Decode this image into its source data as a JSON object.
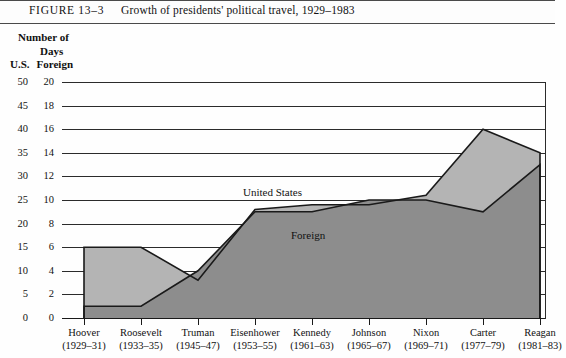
{
  "figure": {
    "number": "FIGURE 13–3",
    "title": "Growth of presidents' political travel, 1929–1983"
  },
  "axis_titles": {
    "line1": "Number of",
    "line2": "Days",
    "us": "U.S.",
    "foreign": "Foreign"
  },
  "colors": {
    "us_fill": "#b4b4b4",
    "foreign_fill": "#8d8d8d",
    "line": "#1a1a1a",
    "grid": "#2b2b2b",
    "background": "#fefefe"
  },
  "labels": {
    "united_states": "United States",
    "foreign": "Foreign"
  },
  "chart_data": {
    "type": "area",
    "title": "Growth of presidents' political travel, 1929–1983",
    "xlabel": "",
    "ylabel": "Number of Days",
    "grid": true,
    "legend": "inline-band-labels",
    "categories": [
      "Hoover",
      "Roosevelt",
      "Truman",
      "Eisenhower",
      "Kennedy",
      "Johnson",
      "Nixon",
      "Carter",
      "Reagan"
    ],
    "category_years": [
      "(1929–31)",
      "(1933–35)",
      "(1945–47)",
      "(1953–55)",
      "(1961–63)",
      "(1965–67)",
      "(1969–71)",
      "(1977–79)",
      "(1981–83)"
    ],
    "axes": {
      "us": {
        "name": "U.S.",
        "ylim": [
          0,
          50
        ],
        "ticks": [
          0,
          5,
          10,
          15,
          20,
          25,
          30,
          35,
          40,
          45,
          50
        ]
      },
      "foreign": {
        "name": "Foreign",
        "ylim": [
          0,
          20
        ],
        "ticks": [
          0,
          2,
          4,
          6,
          8,
          10,
          12,
          14,
          16,
          18,
          20
        ]
      }
    },
    "series": [
      {
        "name": "United States",
        "axis": "us",
        "units": "days",
        "values": [
          15,
          15,
          8,
          23,
          24,
          24,
          26,
          40,
          35
        ]
      },
      {
        "name": "Foreign",
        "axis": "foreign",
        "units": "days",
        "values": [
          1,
          1,
          4,
          9,
          9,
          10,
          10,
          9,
          13
        ]
      }
    ]
  },
  "y_rows": [
    {
      "us": "50",
      "foreign": "20"
    },
    {
      "us": "45",
      "foreign": "18"
    },
    {
      "us": "40",
      "foreign": "16"
    },
    {
      "us": "35",
      "foreign": "14"
    },
    {
      "us": "30",
      "foreign": "12"
    },
    {
      "us": "25",
      "foreign": "10"
    },
    {
      "us": "20",
      "foreign": "8"
    },
    {
      "us": "15",
      "foreign": "6"
    },
    {
      "us": "10",
      "foreign": "4"
    },
    {
      "us": "5",
      "foreign": "2"
    },
    {
      "us": "0",
      "foreign": "0"
    }
  ]
}
